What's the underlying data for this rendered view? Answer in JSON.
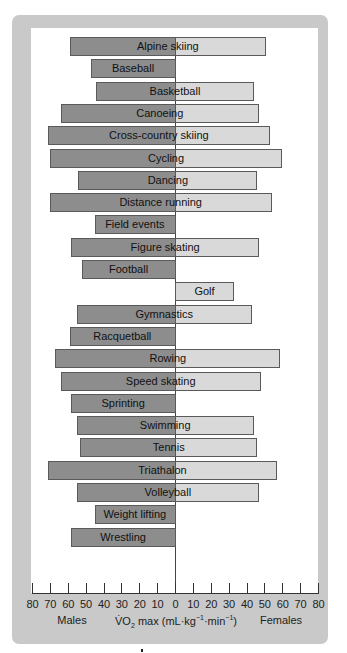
{
  "chart_data": {
    "type": "bar",
    "orientation": "horizontal-diverging",
    "title": "",
    "xlabel": "VO2 max (mL·kg-1·min-1)",
    "xlabel_left": "Males",
    "xlabel_right": "Females",
    "ylabel": "",
    "xlim": [
      -80,
      80
    ],
    "x_ticks": [
      80,
      70,
      60,
      50,
      40,
      30,
      20,
      10,
      0,
      10,
      20,
      30,
      40,
      50,
      60,
      70,
      80
    ],
    "grid": false,
    "legend": "none",
    "categories": [
      "Alpine skiing",
      "Baseball",
      "Basketball",
      "Canoeing",
      "Cross-country skiing",
      "Cycling",
      "Dancing",
      "Distance running",
      "Field events",
      "Figure skating",
      "Football",
      "Golf",
      "Gymnastics",
      "Racquetball",
      "Rowing",
      "Speed skating",
      "Sprinting",
      "Swimming",
      "Tennis",
      "Triathalon",
      "Volleyball",
      "Weight lifting",
      "Wrestling"
    ],
    "series": [
      {
        "name": "Males",
        "color": "#8d8d8d",
        "values": [
          59,
          47,
          44,
          64,
          71,
          70,
          54,
          70,
          45,
          58,
          52,
          null,
          55,
          59,
          67,
          64,
          58,
          55,
          53,
          71,
          55,
          45,
          58
        ]
      },
      {
        "name": "Females",
        "color": "#d9d9d9",
        "values": [
          51,
          null,
          44,
          47,
          53,
          60,
          46,
          54,
          null,
          47,
          null,
          33,
          43,
          null,
          59,
          48,
          null,
          44,
          46,
          57,
          47,
          null,
          null
        ]
      }
    ]
  },
  "axis": {
    "tick_labels": [
      "80",
      "70",
      "60",
      "50",
      "40",
      "30",
      "20",
      "10",
      "0",
      "10",
      "20",
      "30",
      "40",
      "50",
      "60",
      "70",
      "80"
    ],
    "caption_left": "Males",
    "caption_center_prefix": "V̇O",
    "caption_center_sub": "2",
    "caption_center_mid": " max (mL·kg",
    "caption_center_sup1": "−1",
    "caption_center_mid2": "·min",
    "caption_center_sup2": "−1",
    "caption_center_end": ")",
    "caption_right": "Females"
  }
}
